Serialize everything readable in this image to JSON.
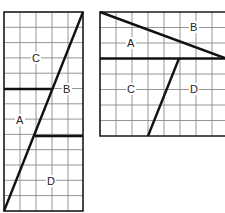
{
  "figures": [
    {
      "id": "figure-1",
      "grid": {
        "columns": 5,
        "rows": 13
      },
      "regions": [
        {
          "label": "C"
        },
        {
          "label": "B"
        },
        {
          "label": "A"
        },
        {
          "label": "D"
        }
      ]
    },
    {
      "id": "figure-2",
      "grid": {
        "columns": 8,
        "rows": 8
      },
      "regions": [
        {
          "label": "B"
        },
        {
          "label": "A"
        },
        {
          "label": "C"
        },
        {
          "label": "D"
        }
      ]
    }
  ],
  "colors": {
    "line": "#111111",
    "grid": "#8a8a8a",
    "background": "#ffffff"
  }
}
